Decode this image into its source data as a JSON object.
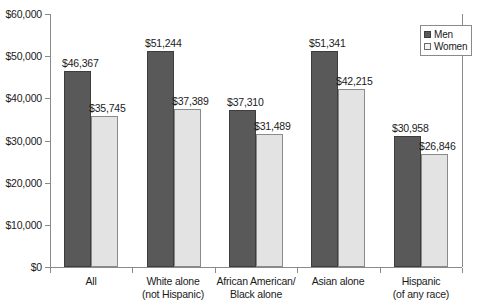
{
  "chart_data": {
    "type": "bar",
    "title": "",
    "subtitle": "",
    "xlabel": "",
    "ylabel": "",
    "ylim": [
      0,
      60000
    ],
    "grid": false,
    "legend_position": "top-right",
    "y_ticks": [
      {
        "value": 60000,
        "label": "$60,000"
      },
      {
        "value": 50000,
        "label": "$50,000"
      },
      {
        "value": 40000,
        "label": "$40,000"
      },
      {
        "value": 30000,
        "label": "$30,000"
      },
      {
        "value": 20000,
        "label": "$20,000"
      },
      {
        "value": 10000,
        "label": "$10,000"
      },
      {
        "value": 0,
        "label": "$0"
      }
    ],
    "categories": [
      {
        "line1": "All",
        "line2": ""
      },
      {
        "line1": "White alone",
        "line2": "(not Hispanic)"
      },
      {
        "line1": "African American/",
        "line2": "Black alone"
      },
      {
        "line1": "Asian alone",
        "line2": ""
      },
      {
        "line1": "Hispanic",
        "line2": "(of any race)"
      }
    ],
    "series": [
      {
        "name": "Men",
        "color": "#595959",
        "values": [
          46367,
          51244,
          37310,
          51341,
          30958
        ],
        "labels": [
          "$46,367",
          "$51,244",
          "$37,310",
          "$51,341",
          "$30,958"
        ]
      },
      {
        "name": "Women",
        "color": "#e3e3e3",
        "values": [
          35745,
          37389,
          31489,
          42215,
          26846
        ],
        "labels": [
          "$35,745",
          "$37,389",
          "$31,489",
          "$42,215",
          "$26,846"
        ]
      }
    ],
    "legend": [
      {
        "label": "Men",
        "color": "#595959"
      },
      {
        "label": "Women",
        "color": "#f2f2f2"
      }
    ]
  }
}
